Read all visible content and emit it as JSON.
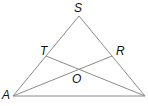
{
  "diagram": {
    "type": "triangle-cevians",
    "points": {
      "S": {
        "label": "S",
        "x": 79,
        "y": 16
      },
      "A": {
        "label": "A",
        "x": 13,
        "y": 96
      },
      "B": {
        "label": "",
        "x": 145,
        "y": 96
      },
      "T": {
        "label": "T",
        "x": 46,
        "y": 56
      },
      "R": {
        "label": "R",
        "x": 112,
        "y": 56
      },
      "O": {
        "label": "O",
        "x": 79,
        "y": 69
      }
    },
    "segments": [
      [
        "S",
        "A"
      ],
      [
        "S",
        "B"
      ],
      [
        "A",
        "B"
      ],
      [
        "A",
        "R"
      ],
      [
        "T",
        "B"
      ]
    ],
    "line_color": "#8a8a8a"
  }
}
